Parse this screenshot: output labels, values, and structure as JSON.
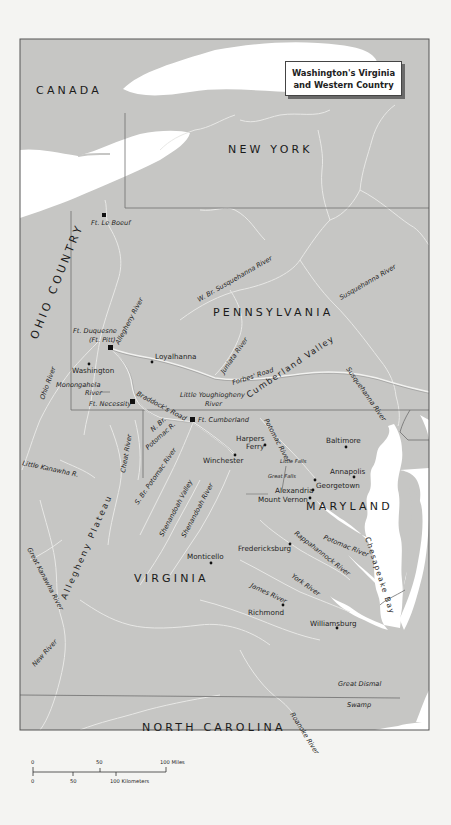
{
  "map": {
    "title_line1": "Washington's Virginia",
    "title_line2": "and Western Country",
    "colors": {
      "land": "#c6c6c4",
      "water": "#ffffff",
      "rivers": "#e8e8e6",
      "borders": "#6e6e6e",
      "roads": "#f2f2f0",
      "frame": "#555555",
      "page": "#f4f4f2"
    },
    "regions": {
      "canada": "CANADA",
      "new_york": "NEW YORK",
      "pennsylvania": "PENNSYLVANIA",
      "ohio_country": "OHIO COUNTRY",
      "maryland": "MARYLAND",
      "virginia": "VIRGINIA",
      "north_carolina": "NORTH CAROLINA"
    },
    "places": {
      "ft_le_boeuf": "Ft. Le Boeuf",
      "ft_duquesne": "Ft. Duquesne",
      "ft_pitt": "(Ft. Pitt)",
      "loyalhanna": "Loyalhanna",
      "washington": "Washington",
      "ft_necessity": "Ft. Necessity",
      "ft_cumberland": "Ft. Cumberland",
      "harpers": "Harpers",
      "ferry": "Ferry",
      "winchester": "Winchester",
      "baltimore": "Baltimore",
      "annapolis": "Annapolis",
      "georgetown": "Georgetown",
      "alexandria": "Alexandria",
      "mount_vernon": "Mount Vernon",
      "fredericksburg": "Fredericksburg",
      "monticello": "Monticello",
      "richmond": "Richmond",
      "williamsburg": "Williamsburg",
      "little_falls": "Little Falls",
      "great_falls": "Great Falls",
      "great_dismal": "Great Dismal",
      "swamp": "Swamp"
    },
    "features": {
      "allegheny_river": "Allegheny River",
      "w_br_susquehanna": "W. Br. Susquehanna River",
      "susquehanna_river_n": "Susquehanna River",
      "susquehanna_river_s": "Susquehanna River",
      "juniata_river": "Juniata River",
      "forbes_road": "Forbes' Road",
      "cumberland_valley": "Cumberland Valley",
      "ohio_river": "Ohio River",
      "monongahela": "Monongahela",
      "monongahela_river": "River",
      "little_youghiogheny": "Little Youghiogheny",
      "little_youghiogheny_river": "River",
      "braddocks_road": "Braddock's Road",
      "n_br_potomac_1": "N. Br.",
      "n_br_potomac_2": "Potomac R.",
      "potomac_river_n": "Potomac River",
      "potomac_river_s": "Potomac River",
      "cheat_river": "Cheat River",
      "s_br_potomac": "S. Br. Potomac River",
      "little_kanawha": "Little Kanawha R.",
      "allegheny_plateau": "Allegheny Plateau",
      "shenandoah_valley": "Shenandoah Valley",
      "shenandoah_river": "Shenandoah River",
      "great_kanawha": "Great Kanawha River",
      "new_river": "New River",
      "rappahannock_river": "Rappahannock River",
      "york_river": "York River",
      "james_river": "James River",
      "chesapeake_bay": "Chesapeake Bay",
      "roanoke_river": "Roanoke River"
    },
    "scale": {
      "miles_0": "0",
      "miles_50": "50",
      "miles_100": "100 Miles",
      "km_0": "0",
      "km_50": "50",
      "km_100": "100 Kilometers"
    }
  }
}
